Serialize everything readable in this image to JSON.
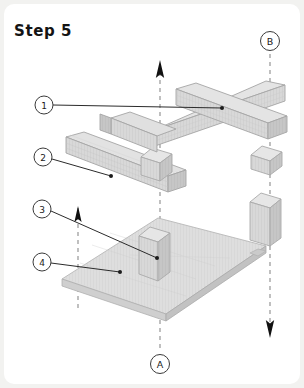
{
  "page": {
    "title": "Step 5",
    "background_color": "#ffffff",
    "card_color": "#ffffff",
    "outer_tint": "#f2f2f0"
  },
  "diagram": {
    "type": "isometric-exploded-assembly",
    "line_color": "#2a2a2a",
    "dashed_color": "#9a9a9a",
    "part_fill_top": "#e3e3e3",
    "part_fill_left": "#c9c9c9",
    "part_fill_right": "#d6d6d6",
    "plate_fill_top": "#dddddd",
    "plate_edge": "#b4b4b4",
    "stroke": "#8c8c8c"
  },
  "callouts": [
    {
      "id": "1",
      "label": "1",
      "cx": 44,
      "cy": 105,
      "r": 9,
      "tip_x": 222,
      "tip_y": 108
    },
    {
      "id": "2",
      "label": "2",
      "cx": 43,
      "cy": 157,
      "r": 9,
      "tip_x": 111,
      "tip_y": 176
    },
    {
      "id": "3",
      "label": "3",
      "cx": 42,
      "cy": 209,
      "r": 9,
      "tip_x": 157,
      "tip_y": 258
    },
    {
      "id": "4",
      "label": "4",
      "cx": 42,
      "cy": 262,
      "r": 9,
      "tip_x": 120,
      "tip_y": 272
    }
  ],
  "markers": [
    {
      "id": "A",
      "label": "A",
      "cx": 160,
      "cy": 364,
      "r": 9.5
    },
    {
      "id": "B",
      "label": "B",
      "cx": 270,
      "cy": 41,
      "r": 9.5
    }
  ],
  "axes": [
    {
      "name": "axis-a-center",
      "x": 160,
      "y1": 62,
      "y2": 352,
      "arrow": "up",
      "arrow_y": 62
    },
    {
      "name": "axis-b-right",
      "x": 270,
      "y1": 54,
      "y2": 332,
      "arrow": "down",
      "arrow_y": 332
    },
    {
      "name": "axis-left-post",
      "x": 78,
      "y1": 206,
      "y2": 312,
      "arrow": "up",
      "arrow_y": 206
    },
    {
      "name": "axis-mid-short",
      "x": 160,
      "y1": 148,
      "y2": 176,
      "arrow": "none",
      "arrow_y": 0
    }
  ],
  "parts": [
    {
      "name": "beam-upper-right",
      "ref": "1"
    },
    {
      "name": "beam-upper-left",
      "ref": "1"
    },
    {
      "name": "beam-diagonal",
      "ref": "2"
    },
    {
      "name": "post-center",
      "ref": "3"
    },
    {
      "name": "post-right",
      "ref": "3"
    },
    {
      "name": "base-plate",
      "ref": "4"
    }
  ]
}
